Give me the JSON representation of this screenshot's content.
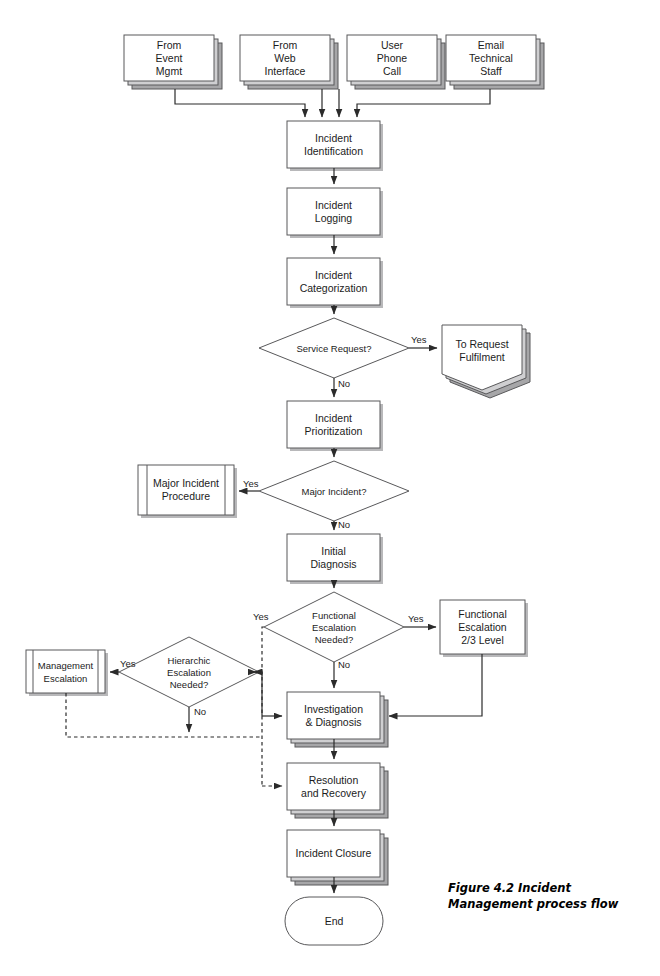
{
  "figure": {
    "caption_line1": "Figure 4.2   Incident",
    "caption_line2": "Management process flow"
  },
  "colors": {
    "stroke": "#58585a",
    "shadow": "#a6a6a8",
    "fill": "#ffffff",
    "text": "#1c1c1c",
    "arrow": "#2b2b2b"
  },
  "sources": [
    {
      "label": "From\nEvent\nMgmt"
    },
    {
      "label": "From\nWeb\nInterface"
    },
    {
      "label": "User\nPhone\nCall"
    },
    {
      "label": "Email\nTechnical\nStaff"
    }
  ],
  "process_nodes": [
    {
      "id": "incident-identification",
      "label": "Incident\nIdentification"
    },
    {
      "id": "incident-logging",
      "label": "Incident\nLogging"
    },
    {
      "id": "incident-categorization",
      "label": "Incident\nCategorization"
    },
    {
      "id": "incident-prioritization",
      "label": "Incident\nPrioritization"
    },
    {
      "id": "initial-diagnosis",
      "label": "Initial\nDiagnosis"
    },
    {
      "id": "functional-escalation",
      "label": "Functional\nEscalation\n2/3 Level"
    },
    {
      "id": "investigation-diagnosis",
      "label": "Investigation\n& Diagnosis"
    },
    {
      "id": "resolution-recovery",
      "label": "Resolution\nand Recovery"
    },
    {
      "id": "incident-closure",
      "label": "Incident Closure"
    }
  ],
  "predefined_nodes": [
    {
      "id": "major-incident-procedure",
      "label": "Major Incident\nProcedure"
    },
    {
      "id": "management-escalation",
      "label": "Management\nEscalation"
    }
  ],
  "decisions": [
    {
      "id": "service-request",
      "label": "Service Request?"
    },
    {
      "id": "major-incident",
      "label": "Major Incident?"
    },
    {
      "id": "functional-escalation-needed",
      "label": "Functional\nEscalation\nNeeded?"
    },
    {
      "id": "hierarchic-escalation-needed",
      "label": "Hierarchic\nEscalation\nNeeded?"
    }
  ],
  "offpage": [
    {
      "id": "to-request-fulfilment",
      "label": "To Request\nFulfilment"
    }
  ],
  "terminator": {
    "id": "end",
    "label": "End"
  },
  "edge_labels": {
    "service_request_yes": "Yes",
    "service_request_no": "No",
    "major_incident_yes": "Yes",
    "major_incident_no": "No",
    "functional_escalation_yes": "Yes",
    "functional_escalation_no": "No",
    "functional_escalation_loop_yes": "Yes",
    "hierarchic_escalation_yes": "Yes",
    "hierarchic_escalation_no": "No"
  }
}
